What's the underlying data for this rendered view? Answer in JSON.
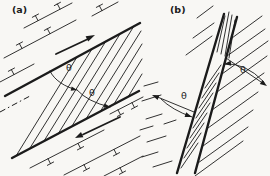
{
  "figure": {
    "panel_a": {
      "label": "(a)",
      "theta_upper": "θ",
      "theta_lower": "θ"
    },
    "panel_b": {
      "label": "(b)",
      "theta_left": "θ",
      "theta_right": "θ"
    }
  },
  "colors": {
    "ink": "#1b1b1b",
    "paper": "#f8f7f4"
  },
  "icons": {
    "shear_sense_arrow": "straight arrow parallel to shear-zone boundary",
    "angle_arc_arrow": "curved arc with arrowhead marking angle θ",
    "bedding_tick": "line with perpendicular T-shaped ticks"
  }
}
